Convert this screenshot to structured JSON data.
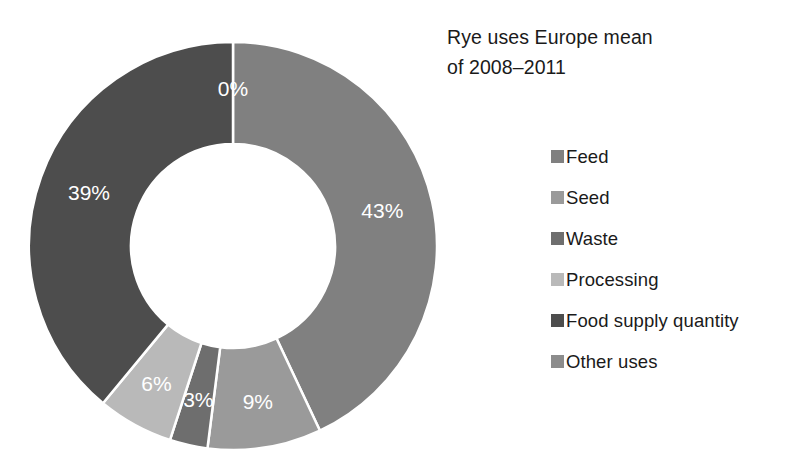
{
  "chart_data": {
    "type": "pie",
    "variant": "donut",
    "title": "Rye uses Europe mean of 2008–2011",
    "title_lines": [
      "Rye uses Europe mean",
      "of 2008–2011"
    ],
    "xlabel": "",
    "ylabel": "",
    "grid": false,
    "legend_position": "right",
    "hole_ratio": 0.5,
    "start_angle_deg": 0,
    "direction": "clockwise",
    "units": "percent",
    "categories": [
      "Feed",
      "Seed",
      "Waste",
      "Processing",
      "Food supply quantity",
      "Other uses"
    ],
    "values": [
      43,
      9,
      3,
      6,
      39,
      0
    ],
    "data_labels": [
      "43%",
      "9%",
      "3%",
      "6%",
      "39%",
      "0%"
    ],
    "slices": [
      {
        "label": "Feed",
        "value": 43,
        "display": "43%",
        "color": "#808080"
      },
      {
        "label": "Seed",
        "value": 9,
        "display": "9%",
        "color": "#9a9a9a"
      },
      {
        "label": "Waste",
        "value": 3,
        "display": "3%",
        "color": "#6e6e6e"
      },
      {
        "label": "Processing",
        "value": 6,
        "display": "6%",
        "color": "#b9b9b9"
      },
      {
        "label": "Food supply quantity",
        "value": 39,
        "display": "39%",
        "color": "#4d4d4d"
      },
      {
        "label": "Other uses",
        "value": 0,
        "display": "0%",
        "color": "#8c8c8c"
      }
    ]
  },
  "title": {
    "line1": "Rye uses Europe mean",
    "line2": "of 2008–2011"
  },
  "legend": {
    "items": [
      {
        "label": "Feed",
        "color": "#808080"
      },
      {
        "label": "Seed",
        "color": "#9a9a9a"
      },
      {
        "label": "Waste",
        "color": "#6e6e6e"
      },
      {
        "label": "Processing",
        "color": "#b9b9b9"
      },
      {
        "label": "Food supply quantity",
        "color": "#4d4d4d"
      },
      {
        "label": "Other uses",
        "color": "#8c8c8c"
      }
    ]
  },
  "labels": {
    "feed": "43%",
    "seed": "9%",
    "waste": "3%",
    "processing": "6%",
    "food_supply_quantity": "39%",
    "other_uses": "0%"
  },
  "colors": {
    "background": "#ffffff",
    "text": "#1a1a1a",
    "slice_label_text": "#ffffff",
    "slice_separator": "#ffffff"
  }
}
